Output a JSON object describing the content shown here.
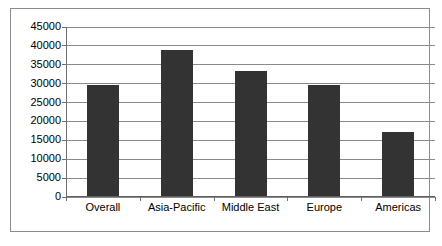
{
  "chart_data": {
    "type": "bar",
    "title": "",
    "subtitle": "",
    "xlabel": "",
    "ylabel": "",
    "categories": [
      "Overall",
      "Asia-Pacific",
      "Middle East",
      "Europe",
      "Americas"
    ],
    "values": [
      29500,
      38700,
      33200,
      29500,
      17000
    ],
    "ylim": [
      0,
      45000
    ],
    "ytick_step": 5000,
    "yticks": [
      0,
      5000,
      10000,
      15000,
      20000,
      25000,
      30000,
      35000,
      40000,
      45000
    ],
    "ytick_labels": [
      "0",
      "5000",
      "10000",
      "15000",
      "20000",
      "25000",
      "30000",
      "35000",
      "40000",
      "45000"
    ],
    "grid": true,
    "legend": false,
    "legend_position": "none",
    "series": [
      {
        "name": "",
        "values": [
          29500,
          38700,
          33200,
          29500,
          17000
        ]
      }
    ]
  },
  "style": {
    "bar_color": "#333333",
    "grid_color": "#8a8a8a",
    "axis_color": "#6f6f6f",
    "frame_color": "#8c8c8c",
    "background": "#ffffff",
    "text_color": "#000000"
  }
}
